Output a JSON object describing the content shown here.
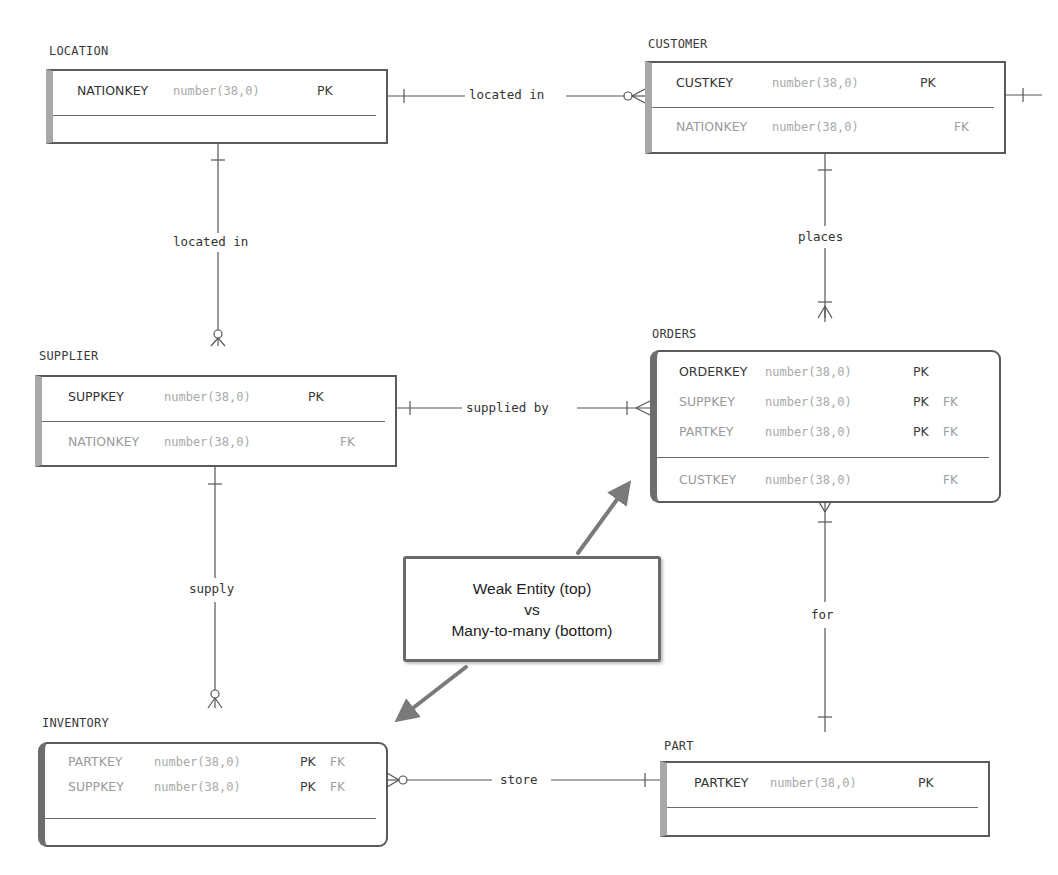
{
  "diagram": {
    "type": "entity-relationship",
    "entities": {
      "location": {
        "name": "LOCATION",
        "keys": [
          {
            "name": "NATIONKEY",
            "type": "number(38,0)",
            "pk": "PK",
            "fk": ""
          }
        ],
        "attributes": []
      },
      "customer": {
        "name": "CUSTOMER",
        "keys": [
          {
            "name": "CUSTKEY",
            "type": "number(38,0)",
            "pk": "PK",
            "fk": ""
          }
        ],
        "attributes": [
          {
            "name": "NATIONKEY",
            "type": "number(38,0)",
            "pk": "",
            "fk": "FK"
          }
        ]
      },
      "supplier": {
        "name": "SUPPLIER",
        "keys": [
          {
            "name": "SUPPKEY",
            "type": "number(38,0)",
            "pk": "PK",
            "fk": ""
          }
        ],
        "attributes": [
          {
            "name": "NATIONKEY",
            "type": "number(38,0)",
            "pk": "",
            "fk": "FK"
          }
        ]
      },
      "orders": {
        "name": "ORDERS",
        "weak": true,
        "keys": [
          {
            "name": "ORDERKEY",
            "type": "number(38,0)",
            "pk": "PK",
            "fk": ""
          },
          {
            "name": "SUPPKEY",
            "type": "number(38,0)",
            "pk": "PK",
            "fk": "FK"
          },
          {
            "name": "PARTKEY",
            "type": "number(38,0)",
            "pk": "PK",
            "fk": "FK"
          }
        ],
        "attributes": [
          {
            "name": "CUSTKEY",
            "type": "number(38,0)",
            "pk": "",
            "fk": "FK"
          }
        ]
      },
      "inventory": {
        "name": "INVENTORY",
        "weak": true,
        "keys": [
          {
            "name": "PARTKEY",
            "type": "number(38,0)",
            "pk": "PK",
            "fk": "FK"
          },
          {
            "name": "SUPPKEY",
            "type": "number(38,0)",
            "pk": "PK",
            "fk": "FK"
          }
        ],
        "attributes": []
      },
      "part": {
        "name": "PART",
        "keys": [
          {
            "name": "PARTKEY",
            "type": "number(38,0)",
            "pk": "PK",
            "fk": ""
          }
        ],
        "attributes": []
      }
    },
    "relationships": {
      "location_customer": {
        "label": "located in",
        "from": "LOCATION",
        "to": "CUSTOMER",
        "from_card": "one",
        "to_card": "zero-or-many"
      },
      "location_supplier": {
        "label": "located in",
        "from": "LOCATION",
        "to": "SUPPLIER",
        "from_card": "one",
        "to_card": "zero-or-many"
      },
      "customer_orders": {
        "label": "places",
        "from": "CUSTOMER",
        "to": "ORDERS",
        "from_card": "one",
        "to_card": "one-or-many"
      },
      "supplier_orders": {
        "label": "supplied by",
        "from": "SUPPLIER",
        "to": "ORDERS",
        "from_card": "one",
        "to_card": "one-or-many"
      },
      "supplier_inventory": {
        "label": "supply",
        "from": "SUPPLIER",
        "to": "INVENTORY",
        "from_card": "one",
        "to_card": "zero-or-many"
      },
      "orders_part": {
        "label": "for",
        "from": "ORDERS",
        "to": "PART",
        "from_card": "one-or-many",
        "to_card": "one"
      },
      "inventory_part": {
        "label": "store",
        "from": "INVENTORY",
        "to": "PART",
        "from_card": "zero-or-many",
        "to_card": "one"
      }
    },
    "callout": {
      "line1": "Weak Entity (top)",
      "line2": "vs",
      "line3": "Many-to-many (bottom)"
    },
    "colors": {
      "border": "#5a5a5a",
      "left_bar": "#a8a8a8",
      "type_text": "#a9a9a9",
      "arrow": "#7a7a7a"
    }
  }
}
